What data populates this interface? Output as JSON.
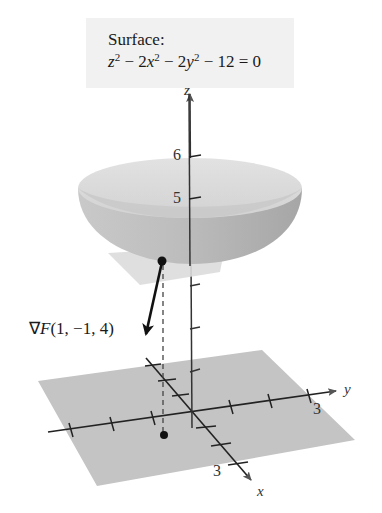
{
  "surface_label": {
    "title": "Surface:",
    "equation_parts": {
      "z": "z",
      "sq1": "2",
      "minus1": " − 2",
      "x": "x",
      "sq2": "2",
      "minus2": " − 2",
      "y": "y",
      "sq3": "2",
      "rest": " − 12 = 0"
    },
    "equation_text": "z² − 2x² − 2y² − 12 = 0"
  },
  "gradient_label": {
    "nabla": "∇",
    "F": "F",
    "args": "(1, −1, 4)",
    "text": "∇F(1, −1, 4)"
  },
  "axes": {
    "z_label": "z",
    "y_label": "y",
    "x_label": "x",
    "z_ticks": [
      "6",
      "5"
    ],
    "y_tick": "3",
    "x_tick": "3"
  },
  "colors": {
    "label_bg": "#f1f1f1",
    "floor": "#c4c4c4",
    "tangent_plane": "#dcdcdc",
    "bowl_outer": "#b8b8b8",
    "bowl_inner": "#d9d9d9",
    "ink": "#1a1a1a"
  }
}
